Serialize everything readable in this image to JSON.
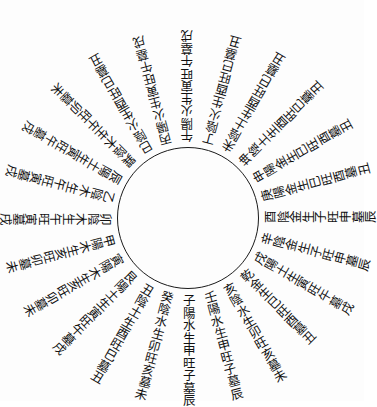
{
  "diagram": {
    "type": "radial-text-wheel",
    "center": {
      "x": 188,
      "y": 218
    },
    "inner_circle_radius": 71,
    "text_start_radius": 76,
    "line_color": "#1a1a1a",
    "text_color": "#111111",
    "spokes": [
      {
        "angle": 90,
        "text": "子陽水生申旺子墓辰"
      },
      {
        "angle": 75,
        "text": "壬陽水生申旺子墓辰"
      },
      {
        "angle": 60,
        "text": "亥陰水生卯旺亥墓未"
      },
      {
        "angle": 45,
        "text": "乾金生巳旺酉墓丑"
      },
      {
        "angle": 30,
        "text": "戌陽土生寅旺午墓戌"
      },
      {
        "angle": 15,
        "text": "辛陰金生子旺申墓辰"
      },
      {
        "angle": 0,
        "text": "酉陰金生子旺申墓辰"
      },
      {
        "angle": -15,
        "text": "庚陽金生巳旺酉墓丑"
      },
      {
        "angle": -30,
        "text": "申陽金生巳旺酉墓丑"
      },
      {
        "angle": -45,
        "text": "坤陰土生酉旺巳墓丑"
      },
      {
        "angle": -60,
        "text": "未陰土生酉旺巳墓丑"
      },
      {
        "angle": -75,
        "text": "丁陰火生酉旺巳墓丑"
      },
      {
        "angle": -90,
        "text": "午陽火生寅旺午墓戌"
      },
      {
        "angle": -105,
        "text": "丙陽火生寅旺午墓戌"
      },
      {
        "angle": -120,
        "text": "巳陰火生酉旺巳墓丑"
      },
      {
        "angle": -135,
        "text": "巽陰木生午旺卯墓未"
      },
      {
        "angle": -150,
        "text": "辰陽土生寅旺午墓戌"
      },
      {
        "angle": -165,
        "text": "乙陰木生午旺寅墓戌"
      },
      {
        "angle": 180,
        "text": "卯陰木生午旺寅墓戌"
      },
      {
        "angle": 165,
        "text": "甲陽木生亥旺卯墓未"
      },
      {
        "angle": 150,
        "text": "寅陽木生亥旺卯墓未"
      },
      {
        "angle": 135,
        "text": "艮陽土生寅旺午墓戌"
      },
      {
        "angle": 120,
        "text": "丑陰土生酉旺巳墓丑"
      },
      {
        "angle": 105,
        "text": "癸陰水生卯旺亥墓未"
      }
    ]
  }
}
